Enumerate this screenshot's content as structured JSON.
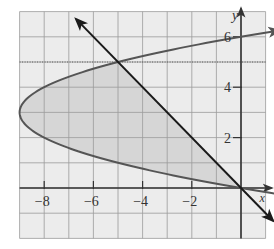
{
  "chart_data": {
    "type": "line",
    "title": "",
    "xlabel": "x",
    "ylabel": "y",
    "xlim": [
      -9,
      1
    ],
    "ylim": [
      -2,
      7
    ],
    "grid": true,
    "x_ticks": [
      -8,
      -6,
      -4,
      -2
    ],
    "y_ticks": [
      2,
      4,
      6
    ],
    "x_tick_labels": [
      "−8",
      "−6",
      "−4",
      "−2"
    ],
    "y_tick_labels": [
      "2",
      "4",
      "6"
    ],
    "series": [
      {
        "name": "parabola",
        "equation": "x = y^2 - 6y",
        "points": [
          [
            0,
            0
          ],
          [
            -5,
            1
          ],
          [
            -8,
            2
          ],
          [
            -9,
            3
          ],
          [
            -8,
            4
          ],
          [
            -5,
            5
          ],
          [
            0,
            6
          ],
          [
            1,
            6.16
          ]
        ],
        "color": "#555555"
      },
      {
        "name": "line",
        "equation": "y = -x",
        "points": [
          [
            -6.7,
            6.7
          ],
          [
            -5,
            5
          ],
          [
            0,
            0
          ],
          [
            1.3,
            -1.3
          ]
        ],
        "color": "#1a1a1a"
      }
    ],
    "intersections": [
      [
        -5,
        5
      ],
      [
        0,
        0
      ]
    ],
    "shaded_region": "between parabola x = y^2 - 6y and line y = -x for 0 ≤ y ≤ 5",
    "annotations": [
      {
        "type": "dotted-line",
        "y": 5,
        "description": "horizontal dotted line through intersection"
      }
    ]
  },
  "colors": {
    "grid_bg": "#ececec",
    "grid_line": "#9a9a9a",
    "shade": "#d6d6d6",
    "axis": "#333333",
    "parabola": "#555555",
    "line": "#1a1a1a"
  }
}
